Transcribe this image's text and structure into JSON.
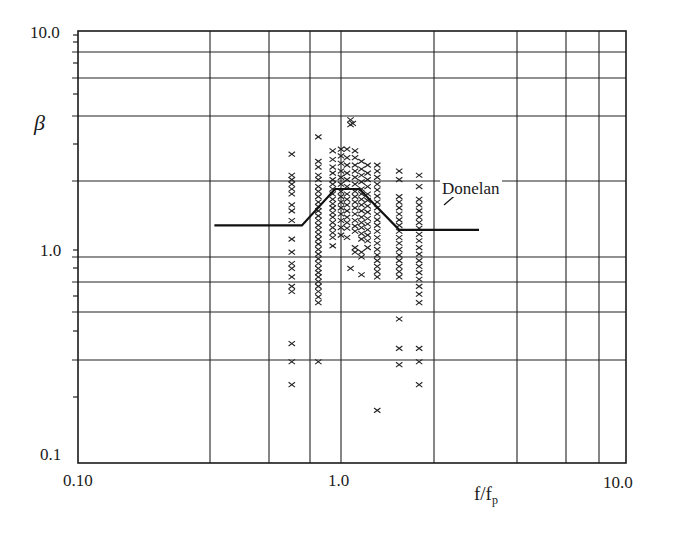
{
  "chart_data": {
    "type": "scatter",
    "title": "",
    "xlabel": "f/f_p",
    "xlabel_main": "f/f",
    "xlabel_sub": "p",
    "ylabel": "β",
    "xscale": "log",
    "yscale": "log",
    "xlim": [
      0.1,
      10.0
    ],
    "ylim": [
      0.1,
      10.0
    ],
    "grid": true,
    "x_tick_labels": [
      "0.10",
      "1.0",
      "10.0"
    ],
    "y_tick_labels": [
      "0.1",
      "1.0",
      "10.0"
    ],
    "x_gridlines_px": [
      210,
      269,
      310,
      341,
      434,
      517,
      566,
      599
    ],
    "y_gridlines_px": [
      52,
      78,
      116,
      181,
      257,
      282,
      312,
      360
    ],
    "series": [
      {
        "name": "Measured β",
        "marker": "x",
        "points": [
          [
            0.65,
            2.85
          ],
          [
            0.65,
            2.3
          ],
          [
            0.65,
            2.2
          ],
          [
            0.65,
            2.1
          ],
          [
            0.65,
            2.0
          ],
          [
            0.65,
            1.9
          ],
          [
            0.65,
            1.7
          ],
          [
            0.65,
            1.6
          ],
          [
            0.65,
            1.45
          ],
          [
            0.65,
            1.2
          ],
          [
            0.65,
            1.05
          ],
          [
            0.65,
            0.93
          ],
          [
            0.65,
            0.88
          ],
          [
            0.65,
            0.8
          ],
          [
            0.65,
            0.72
          ],
          [
            0.65,
            0.68
          ],
          [
            0.65,
            0.38
          ],
          [
            0.65,
            0.31
          ],
          [
            0.65,
            0.24
          ],
          [
            0.82,
            3.4
          ],
          [
            0.82,
            2.65
          ],
          [
            0.82,
            2.5
          ],
          [
            0.82,
            2.3
          ],
          [
            0.82,
            2.2
          ],
          [
            0.82,
            2.05
          ],
          [
            0.82,
            1.95
          ],
          [
            0.82,
            1.85
          ],
          [
            0.82,
            1.75
          ],
          [
            0.82,
            1.67
          ],
          [
            0.82,
            1.6
          ],
          [
            0.82,
            1.52
          ],
          [
            0.82,
            1.45
          ],
          [
            0.82,
            1.38
          ],
          [
            0.82,
            1.32
          ],
          [
            0.82,
            1.26
          ],
          [
            0.82,
            1.2
          ],
          [
            0.82,
            1.14
          ],
          [
            0.82,
            1.08
          ],
          [
            0.82,
            1.03
          ],
          [
            0.82,
            0.98
          ],
          [
            0.82,
            0.93
          ],
          [
            0.82,
            0.88
          ],
          [
            0.82,
            0.84
          ],
          [
            0.82,
            0.8
          ],
          [
            0.82,
            0.76
          ],
          [
            0.82,
            0.72
          ],
          [
            0.82,
            0.68
          ],
          [
            0.82,
            0.64
          ],
          [
            0.82,
            0.6
          ],
          [
            0.82,
            0.31
          ],
          [
            0.93,
            2.95
          ],
          [
            0.93,
            2.7
          ],
          [
            0.93,
            2.5
          ],
          [
            0.93,
            2.35
          ],
          [
            0.93,
            2.2
          ],
          [
            0.93,
            2.1
          ],
          [
            0.93,
            2.0
          ],
          [
            0.93,
            1.9
          ],
          [
            0.93,
            1.8
          ],
          [
            0.93,
            1.72
          ],
          [
            0.93,
            1.65
          ],
          [
            0.93,
            1.57
          ],
          [
            0.93,
            1.5
          ],
          [
            0.93,
            1.42
          ],
          [
            0.93,
            1.35
          ],
          [
            0.93,
            1.28
          ],
          [
            0.93,
            1.22
          ],
          [
            0.93,
            1.12
          ],
          [
            1.0,
            3.0
          ],
          [
            1.0,
            2.8
          ],
          [
            1.0,
            2.6
          ],
          [
            1.0,
            2.4
          ],
          [
            1.0,
            2.25
          ],
          [
            1.0,
            2.1
          ],
          [
            1.0,
            1.95
          ],
          [
            1.0,
            1.85
          ],
          [
            1.0,
            1.75
          ],
          [
            1.0,
            1.65
          ],
          [
            1.0,
            1.55
          ],
          [
            1.0,
            1.45
          ],
          [
            1.0,
            1.35
          ],
          [
            1.0,
            1.25
          ],
          [
            1.08,
            4.05
          ],
          [
            1.08,
            3.85
          ],
          [
            1.1,
            3.9
          ],
          [
            1.05,
            3.0
          ],
          [
            1.05,
            2.75
          ],
          [
            1.05,
            2.55
          ],
          [
            1.05,
            2.35
          ],
          [
            1.05,
            2.2
          ],
          [
            1.05,
            2.05
          ],
          [
            1.05,
            1.9
          ],
          [
            1.05,
            1.8
          ],
          [
            1.05,
            1.7
          ],
          [
            1.05,
            1.6
          ],
          [
            1.05,
            1.5
          ],
          [
            1.05,
            1.42
          ],
          [
            1.05,
            1.34
          ],
          [
            1.05,
            1.22
          ],
          [
            1.08,
            0.88
          ],
          [
            1.12,
            2.95
          ],
          [
            1.12,
            2.75
          ],
          [
            1.12,
            2.55
          ],
          [
            1.12,
            2.4
          ],
          [
            1.12,
            2.25
          ],
          [
            1.12,
            2.1
          ],
          [
            1.12,
            1.95
          ],
          [
            1.12,
            1.85
          ],
          [
            1.12,
            1.75
          ],
          [
            1.12,
            1.65
          ],
          [
            1.12,
            1.55
          ],
          [
            1.12,
            1.45
          ],
          [
            1.12,
            1.37
          ],
          [
            1.12,
            1.3
          ],
          [
            1.12,
            1.1
          ],
          [
            1.12,
            1.05
          ],
          [
            1.18,
            2.65
          ],
          [
            1.18,
            2.45
          ],
          [
            1.18,
            2.3
          ],
          [
            1.18,
            2.15
          ],
          [
            1.18,
            2.0
          ],
          [
            1.18,
            1.9
          ],
          [
            1.18,
            1.8
          ],
          [
            1.18,
            1.7
          ],
          [
            1.18,
            1.6
          ],
          [
            1.18,
            1.5
          ],
          [
            1.18,
            1.42
          ],
          [
            1.18,
            1.35
          ],
          [
            1.18,
            1.27
          ],
          [
            1.18,
            1.2
          ],
          [
            1.18,
            1.05
          ],
          [
            1.18,
            1.0
          ],
          [
            1.18,
            0.82
          ],
          [
            1.24,
            2.55
          ],
          [
            1.24,
            2.35
          ],
          [
            1.24,
            2.2
          ],
          [
            1.24,
            2.05
          ],
          [
            1.24,
            1.9
          ],
          [
            1.24,
            1.78
          ],
          [
            1.24,
            1.68
          ],
          [
            1.24,
            1.58
          ],
          [
            1.24,
            1.48
          ],
          [
            1.24,
            1.4
          ],
          [
            1.24,
            1.32
          ],
          [
            1.24,
            1.25
          ],
          [
            1.24,
            1.18
          ],
          [
            1.24,
            1.1
          ],
          [
            1.34,
            2.55
          ],
          [
            1.34,
            2.4
          ],
          [
            1.34,
            2.25
          ],
          [
            1.34,
            2.1
          ],
          [
            1.34,
            1.98
          ],
          [
            1.34,
            1.86
          ],
          [
            1.34,
            1.75
          ],
          [
            1.34,
            1.65
          ],
          [
            1.34,
            1.55
          ],
          [
            1.34,
            1.46
          ],
          [
            1.34,
            1.38
          ],
          [
            1.34,
            1.3
          ],
          [
            1.34,
            1.22
          ],
          [
            1.34,
            1.15
          ],
          [
            1.34,
            1.08
          ],
          [
            1.34,
            1.02
          ],
          [
            1.34,
            0.96
          ],
          [
            1.34,
            0.9
          ],
          [
            1.34,
            0.85
          ],
          [
            1.34,
            0.8
          ],
          [
            1.34,
            0.18
          ],
          [
            1.6,
            2.4
          ],
          [
            1.6,
            2.2
          ],
          [
            1.6,
            1.85
          ],
          [
            1.6,
            1.75
          ],
          [
            1.6,
            1.65
          ],
          [
            1.6,
            1.55
          ],
          [
            1.6,
            1.46
          ],
          [
            1.6,
            1.38
          ],
          [
            1.6,
            1.3
          ],
          [
            1.6,
            1.22
          ],
          [
            1.6,
            1.15
          ],
          [
            1.6,
            1.08
          ],
          [
            1.6,
            1.02
          ],
          [
            1.6,
            0.96
          ],
          [
            1.6,
            0.9
          ],
          [
            1.6,
            0.85
          ],
          [
            1.6,
            0.8
          ],
          [
            1.6,
            0.5
          ],
          [
            1.6,
            0.36
          ],
          [
            1.6,
            0.3
          ],
          [
            1.88,
            2.3
          ],
          [
            1.88,
            2.05
          ],
          [
            1.88,
            1.8
          ],
          [
            1.88,
            1.7
          ],
          [
            1.88,
            1.6
          ],
          [
            1.88,
            1.5
          ],
          [
            1.88,
            1.42
          ],
          [
            1.88,
            1.34
          ],
          [
            1.88,
            1.26
          ],
          [
            1.88,
            1.18
          ],
          [
            1.88,
            1.1
          ],
          [
            1.88,
            1.03
          ],
          [
            1.88,
            0.96
          ],
          [
            1.88,
            0.9
          ],
          [
            1.88,
            0.84
          ],
          [
            1.88,
            0.78
          ],
          [
            1.88,
            0.72
          ],
          [
            1.88,
            0.66
          ],
          [
            1.88,
            0.6
          ],
          [
            1.88,
            0.36
          ],
          [
            1.88,
            0.31
          ],
          [
            1.88,
            0.24
          ]
        ]
      },
      {
        "name": "Donelan",
        "type": "line",
        "points": [
          [
            0.33,
            1.38
          ],
          [
            0.71,
            1.38
          ],
          [
            0.95,
            2.0
          ],
          [
            1.16,
            2.0
          ],
          [
            1.6,
            1.32
          ],
          [
            3.05,
            1.32
          ]
        ]
      }
    ],
    "annotations": [
      {
        "text": "Donelan",
        "x_px": 440,
        "y_px": 180
      }
    ]
  },
  "axes": {
    "y_label": "β",
    "y_ticks": {
      "top": "10.0",
      "mid": "1.0",
      "bottom": "0.1"
    },
    "x_ticks": {
      "left": "0.10",
      "mid": "1.0",
      "right": "10.0"
    },
    "x_label_main": "f/f",
    "x_label_sub": "p"
  },
  "legend": {
    "donelan_label": "Donelan"
  }
}
